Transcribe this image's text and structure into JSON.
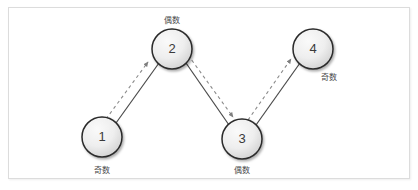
{
  "canvas": {
    "width": 418,
    "height": 190,
    "background": "#ffffff",
    "border_color": "#dcdcdc"
  },
  "theme": {
    "node_fill_light": "#f2f2f2",
    "node_fill_dark": "#d4d4d4",
    "node_stroke": "#2b2b2b",
    "edge_color": "#4a4a4a",
    "arrow_color": "#8a8a8a",
    "text_color": "#3a3a3a",
    "label_color": "#4a4a4a"
  },
  "diagram": {
    "type": "graph",
    "nodes": [
      {
        "id": "n1",
        "number": "1",
        "label": "奇数",
        "label_position": "below",
        "cx": 102,
        "cy": 137,
        "r": 20,
        "label_x": 102,
        "label_y": 170
      },
      {
        "id": "n2",
        "number": "2",
        "label": "偶数",
        "label_position": "above",
        "cx": 172,
        "cy": 49,
        "r": 20,
        "label_x": 172,
        "label_y": 20
      },
      {
        "id": "n3",
        "number": "3",
        "label": "偶数",
        "label_position": "below",
        "cx": 242,
        "cy": 139,
        "r": 20,
        "label_x": 242,
        "label_y": 170
      },
      {
        "id": "n4",
        "number": "4",
        "label": "奇数",
        "label_position": "below-right",
        "cx": 313,
        "cy": 49,
        "r": 20,
        "label_x": 329,
        "label_y": 77
      }
    ],
    "edges": [
      {
        "id": "e1",
        "from": "n1",
        "to": "n2",
        "style": "solid",
        "x1": 116,
        "y1": 123,
        "x2": 159,
        "y2": 63
      },
      {
        "id": "e2",
        "from": "n2",
        "to": "n3",
        "style": "solid",
        "x1": 186,
        "y1": 63,
        "x2": 229,
        "y2": 125
      },
      {
        "id": "e3",
        "from": "n3",
        "to": "n4",
        "style": "solid",
        "x1": 256,
        "y1": 125,
        "x2": 300,
        "y2": 63
      }
    ],
    "arrows": [
      {
        "id": "a1",
        "from": "n1",
        "to": "n2",
        "style": "dashed",
        "direction": "up-right",
        "x1": 108,
        "y1": 118,
        "x2": 149,
        "y2": 63
      },
      {
        "id": "a2",
        "from": "n2",
        "to": "n3",
        "style": "dashed",
        "direction": "down-right",
        "x1": 188,
        "y1": 56,
        "x2": 234,
        "y2": 118
      },
      {
        "id": "a3",
        "from": "n3",
        "to": "n4",
        "style": "dashed",
        "direction": "up-right",
        "x1": 249,
        "y1": 119,
        "x2": 292,
        "y2": 60
      }
    ]
  }
}
